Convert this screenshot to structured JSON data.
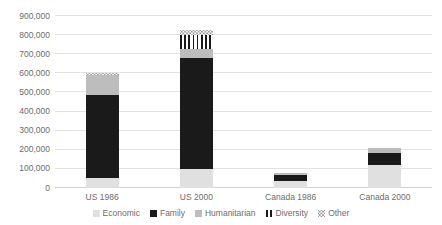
{
  "chart_data": {
    "type": "bar",
    "subtype": "stacked-bar",
    "title": "",
    "subtitle": "",
    "xlabel": "",
    "ylabel": "",
    "categories": [
      "US 1986",
      "US 2000",
      "Canada 1986",
      "Canada 2000"
    ],
    "series": [
      {
        "name": "Economic",
        "color": "#e0e0e0",
        "pattern": "solid",
        "values": [
          50000,
          100000,
          35000,
          120000
        ]
      },
      {
        "name": "Family",
        "color": "#1a1a1a",
        "pattern": "solid",
        "values": [
          435000,
          580000,
          35000,
          65000
        ]
      },
      {
        "name": "Humanitarian",
        "color": "#bdbdbd",
        "pattern": "solid",
        "values": [
          105000,
          50000,
          10000,
          25000
        ]
      },
      {
        "name": "Diversity",
        "color": "#1a1a1a",
        "pattern": "vertical-stripes",
        "values": [
          0,
          70000,
          0,
          0
        ]
      },
      {
        "name": "Other",
        "color": "#9a9a9a",
        "pattern": "dots",
        "values": [
          10000,
          25000,
          0,
          0
        ]
      }
    ],
    "totals": [
      600000,
      825000,
      80000,
      210000
    ],
    "ylim": [
      0,
      900000
    ],
    "y_ticks": [
      0,
      100000,
      200000,
      300000,
      400000,
      500000,
      600000,
      700000,
      800000,
      900000
    ],
    "y_tick_labels": [
      "0",
      "100,000",
      "200,000",
      "300,000",
      "400,000",
      "500,000",
      "600,000",
      "700,000",
      "800,000",
      "900,000"
    ],
    "grid": true,
    "grid_axis": "y",
    "legend_position": "bottom",
    "legend_entries": [
      "Economic",
      "Family",
      "Humanitarian",
      "Diversity",
      "Other"
    ]
  },
  "axes": {
    "y_tick_labels": [
      "900,000",
      "800,000",
      "700,000",
      "600,000",
      "500,000",
      "400,000",
      "300,000",
      "200,000",
      "100,000",
      "0"
    ],
    "x_tick_labels": [
      "US 1986",
      "US 2000",
      "Canada 1986",
      "Canada 2000"
    ]
  },
  "legend": {
    "items": [
      {
        "label": "Economic",
        "swatch": "economic-swatch-icon"
      },
      {
        "label": "Family",
        "swatch": "family-swatch-icon"
      },
      {
        "label": "Humanitarian",
        "swatch": "humanitarian-swatch-icon"
      },
      {
        "label": "Diversity",
        "swatch": "diversity-swatch-icon"
      },
      {
        "label": "Other",
        "swatch": "other-swatch-icon"
      }
    ]
  }
}
